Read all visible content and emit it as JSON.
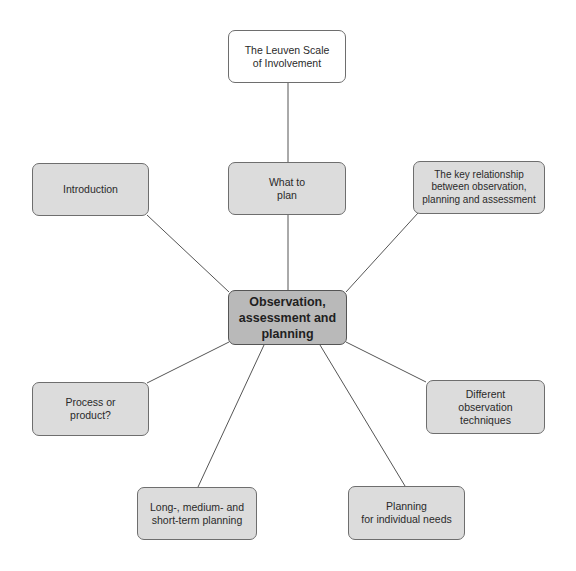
{
  "diagram": {
    "type": "mind-map",
    "center": {
      "label": "Observation,\nassessment and\nplanning"
    },
    "nodes": [
      {
        "id": "leuven",
        "label": "The Leuven Scale\nof Involvement"
      },
      {
        "id": "introduction",
        "label": "Introduction"
      },
      {
        "id": "what-to-plan",
        "label": "What to\nplan"
      },
      {
        "id": "key-relationship",
        "label": "The key relationship\nbetween observation,\nplanning and assessment"
      },
      {
        "id": "process-product",
        "label": "Process or\nproduct?"
      },
      {
        "id": "observation-techniques",
        "label": "Different\nobservation\ntechniques"
      },
      {
        "id": "long-medium-short",
        "label": "Long-, medium- and\nshort-term planning"
      },
      {
        "id": "individual-needs",
        "label": "Planning\nfor individual needs"
      }
    ],
    "edges": [
      [
        "leuven",
        "what-to-plan"
      ],
      [
        "what-to-plan",
        "center"
      ],
      [
        "introduction",
        "center"
      ],
      [
        "key-relationship",
        "center"
      ],
      [
        "process-product",
        "center"
      ],
      [
        "observation-techniques",
        "center"
      ],
      [
        "long-medium-short",
        "center"
      ],
      [
        "individual-needs",
        "center"
      ]
    ],
    "colors": {
      "node_fill": "#dcdcdc",
      "center_fill": "#b9b9b9",
      "top_fill": "#ffffff",
      "line": "#555555"
    }
  }
}
